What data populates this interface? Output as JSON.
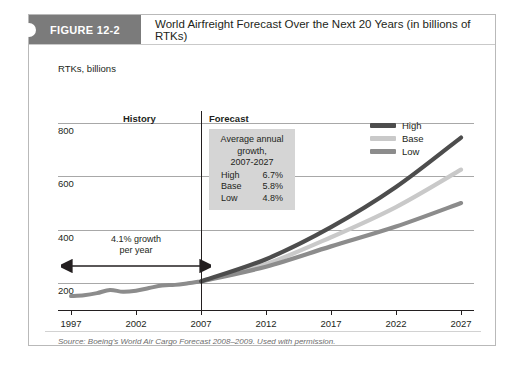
{
  "figure": {
    "tag": "FIGURE 12-2",
    "title": "World Airfreight Forecast Over the Next 20 Years (in billions of RTKs)",
    "source": "Source: Boeing's World Air Cargo Forecast 2008–2009. Used with permission."
  },
  "sections": {
    "history_label": "History",
    "forecast_label": "Forecast"
  },
  "annotations": {
    "history_growth_line1": "4.1% growth",
    "history_growth_line2": "per year",
    "growth_box": {
      "line1": "Average annual",
      "line2": "growth,",
      "line3": "2007-2027",
      "rows": [
        {
          "name": "High",
          "value": "6.7%"
        },
        {
          "name": "Base",
          "value": "5.8%"
        },
        {
          "name": "Low",
          "value": "4.8%"
        }
      ]
    }
  },
  "colors": {
    "high": "#4d4d4d",
    "base": "#c9c9c9",
    "low": "#8c8c8c",
    "tag_background": "#7b7b7b",
    "annotation_background": "#d5d5d5",
    "axis": "#231f20",
    "gridline": "#a8a8a8"
  },
  "chart_data": {
    "type": "line",
    "title": "World Airfreight Forecast Over the Next 20 Years (in billions of RTKs)",
    "xlabel": "",
    "ylabel": "RTKs, billions",
    "ylabel_text": "RTKs, billions",
    "xlim": [
      1996,
      2028
    ],
    "ylim": [
      100,
      820
    ],
    "yticks": [
      200,
      400,
      600,
      800
    ],
    "ytick_labels": [
      "200",
      "400",
      "600",
      "800"
    ],
    "xticks": [
      1997,
      2002,
      2007,
      2012,
      2017,
      2022,
      2027
    ],
    "xtick_labels": [
      "1997",
      "2002",
      "2007",
      "2012",
      "2017",
      "2022",
      "2027"
    ],
    "grid": true,
    "legend_position": "top-right",
    "legend": [
      "High",
      "Base",
      "Low"
    ],
    "forecast_divider_x": 2007,
    "history": {
      "name": "History",
      "color": "#8c8c8c",
      "x": [
        1997,
        1998,
        1999,
        2000,
        2001,
        2002,
        2003,
        2004,
        2005,
        2006,
        2007
      ],
      "values": [
        152,
        155,
        163,
        175,
        168,
        172,
        182,
        192,
        194,
        200,
        207
      ]
    },
    "series": [
      {
        "name": "High",
        "color": "#4d4d4d",
        "growth_rate": "6.7%",
        "x": [
          2007,
          2012,
          2017,
          2022,
          2027
        ],
        "values": [
          207,
          290,
          410,
          560,
          745
        ]
      },
      {
        "name": "Base",
        "color": "#c9c9c9",
        "growth_rate": "5.8%",
        "x": [
          2007,
          2012,
          2017,
          2022,
          2027
        ],
        "values": [
          207,
          272,
          372,
          485,
          625
        ]
      },
      {
        "name": "Low",
        "color": "#8c8c8c",
        "growth_rate": "4.8%",
        "x": [
          2007,
          2012,
          2017,
          2022,
          2027
        ],
        "values": [
          207,
          262,
          338,
          412,
          500
        ]
      }
    ],
    "annotations": [
      {
        "text": "4.1% growth per year",
        "span_x": [
          1997,
          2007
        ],
        "y": 265
      },
      {
        "text": "Average annual growth, 2007-2027: High 6.7%, Base 5.8%, Low 4.8%"
      }
    ]
  }
}
